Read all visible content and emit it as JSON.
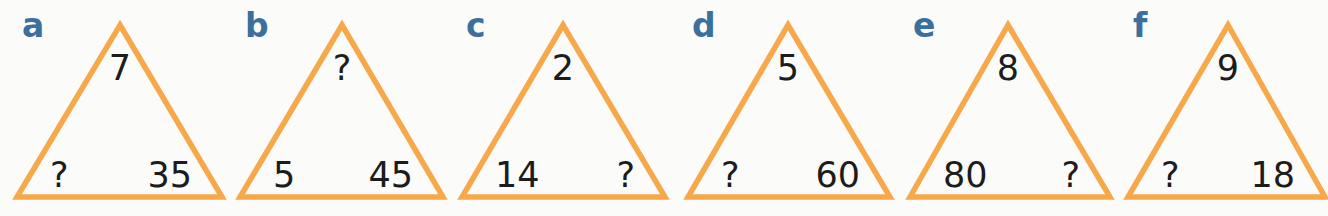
{
  "style": {
    "triangle_stroke": "#f6a84a",
    "label_color": "#3b6f9c",
    "number_color": "#1c1c1c",
    "background": "#fbfbfa"
  },
  "puzzles": [
    {
      "label": "a",
      "top": "7",
      "bottom_left": "?",
      "bottom_right": "35",
      "label_x": 22,
      "apex_x": 120,
      "left_x": 17,
      "right_x": 222
    },
    {
      "label": "b",
      "top": "?",
      "bottom_left": "5",
      "bottom_right": "45",
      "label_x": 245,
      "apex_x": 342,
      "left_x": 240,
      "right_x": 443
    },
    {
      "label": "c",
      "top": "2",
      "bottom_left": "14",
      "bottom_right": "?",
      "label_x": 466,
      "apex_x": 563,
      "left_x": 462,
      "right_x": 665
    },
    {
      "label": "d",
      "top": "5",
      "bottom_left": "?",
      "bottom_right": "60",
      "label_x": 692,
      "apex_x": 788,
      "left_x": 688,
      "right_x": 890
    },
    {
      "label": "e",
      "top": "8",
      "bottom_left": "80",
      "bottom_right": "?",
      "label_x": 913,
      "apex_x": 1008,
      "left_x": 910,
      "right_x": 1110
    },
    {
      "label": "f",
      "top": "9",
      "bottom_left": "?",
      "bottom_right": "18",
      "label_x": 1133,
      "apex_x": 1228,
      "left_x": 1128,
      "right_x": 1325
    }
  ]
}
